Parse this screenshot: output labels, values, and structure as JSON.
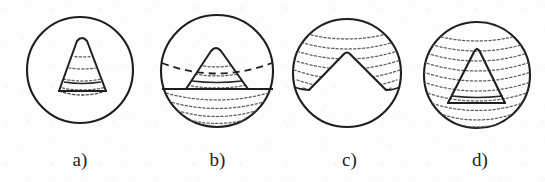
{
  "figure": {
    "kind": "line-diagram",
    "background_color": "#fdfdfd",
    "ink_color": "#1f1f1f",
    "hatch_color": "#6d6d6d",
    "panel_count": 4
  },
  "panels": [
    {
      "id": "panel-a",
      "label": "a)",
      "label_x": 84,
      "label_y": 150,
      "circle": {
        "cx": 80,
        "cy": 70,
        "r": 53
      },
      "shape": "cone-inside-circle",
      "cone": {
        "apex_x": 82,
        "apex_y": 37,
        "base_left_x": 59,
        "base_right_x": 106,
        "base_y": 91
      },
      "hatch_arc_count": 3,
      "base_style": "dotted-ellipse",
      "notes": "cone fully contained within circle, interior cross-hatched with dotted arcs"
    },
    {
      "id": "panel-b",
      "label": "b)",
      "label_x": 218,
      "label_y": 150,
      "circle": {
        "cx": 217,
        "cy": 71,
        "r": 57
      },
      "shape": "cone-with-equator-and-dotted-cap",
      "cone": {
        "apex_x": 216,
        "apex_y": 46,
        "base_left_x": 186,
        "base_right_x": 248,
        "base_y": 89
      },
      "dashed_ellipse_y": 63,
      "solid_chord_y": 89,
      "hatch_arc_count": 4,
      "notes": "dashed ellipse across upper sphere, solid chord at cone base, dotted arcs filling lower cap"
    },
    {
      "id": "panel-c",
      "label": "c)",
      "label_x": 347,
      "label_y": 150,
      "circle": {
        "cx": 347,
        "cy": 73,
        "r": 54
      },
      "shape": "conical-notch-removed-from-top",
      "notch": {
        "apex_x": 347,
        "apex_y": 52,
        "left_x": 309,
        "right_x": 386,
        "bottom_y": 90
      },
      "hatch_arc_count": 5,
      "notes": "inverted cone carved out of top of sphere, remaining upper band filled with dotted arcs"
    },
    {
      "id": "panel-d",
      "label": "d)",
      "label_x": 477,
      "label_y": 150,
      "circle": {
        "cx": 477,
        "cy": 75,
        "r": 53
      },
      "shape": "cone-over-fully-hatched-circle",
      "cone": {
        "apex_x": 476,
        "apex_y": 47,
        "base_left_x": 447,
        "base_right_x": 503,
        "base_y": 103
      },
      "hatch_arc_count": 9,
      "notes": "entire sphere filled with dotted arcs, solid cone outline drawn on top"
    }
  ]
}
